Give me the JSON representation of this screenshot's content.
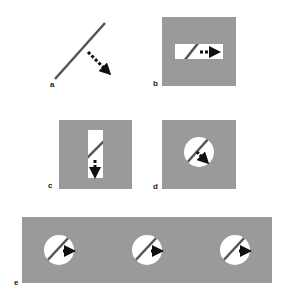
{
  "figure": {
    "panels": [
      {
        "label": "a",
        "description": "oriented bar with motion arrow, no aperture"
      },
      {
        "label": "b",
        "description": "horizontal rectangular aperture"
      },
      {
        "label": "c",
        "description": "vertical rectangular aperture"
      },
      {
        "label": "d",
        "description": "circular aperture"
      },
      {
        "label": "e",
        "description": "three circular apertures"
      }
    ],
    "colors": {
      "background": "#ffffff",
      "occluder": "#9a9a9a",
      "aperture": "#ffffff",
      "line": "#555555",
      "arrow": "#111111"
    }
  }
}
